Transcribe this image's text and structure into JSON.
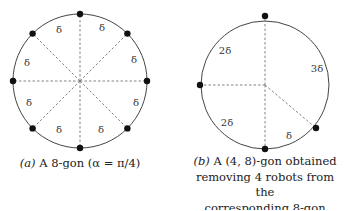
{
  "figure_a": {
    "caption_prefix": "(a)",
    "caption_text": "A 8-gon (α = π/4)",
    "circle": {
      "cx": 80,
      "cy": 81,
      "r": 67
    },
    "robots": 8,
    "arc_labels": [
      "δ",
      "δ",
      "δ",
      "δ",
      "δ",
      "δ",
      "δ",
      "δ"
    ]
  },
  "figure_b": {
    "caption_prefix": "(b)",
    "caption_line1": "A (4, 8)-gon obtained",
    "caption_line2": "removing 4 robots from the",
    "caption_line3": "corresponding 8-gon",
    "circle": {
      "cx": 265,
      "cy": 85,
      "r": 64
    },
    "robots": 4,
    "arc_labels": [
      "2δ",
      "3δ",
      "δ",
      "2δ"
    ]
  },
  "colors": {
    "line": "#444444",
    "dot": "#111111",
    "dashed": "#777777"
  }
}
